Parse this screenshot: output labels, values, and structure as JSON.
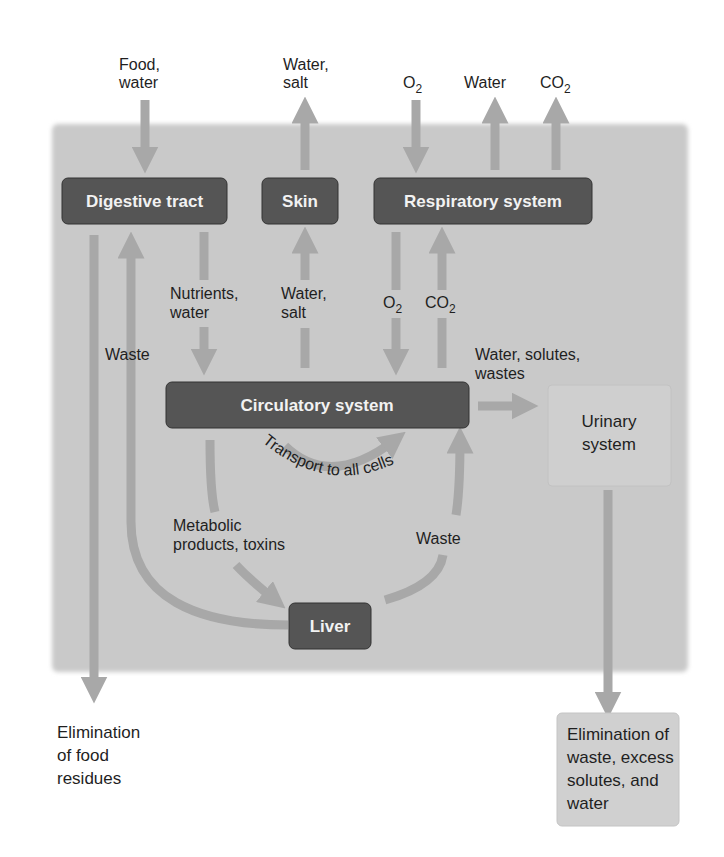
{
  "colors": {
    "panel": "#c9c9c9",
    "dark_box": "#555555",
    "light_box": "#d0d0d0",
    "arrow": "#a8a8a8",
    "background": "#ffffff"
  },
  "nodes": {
    "digestive": "Digestive tract",
    "skin": "Skin",
    "respiratory": "Respiratory system",
    "circulatory": "Circulatory system",
    "liver": "Liver",
    "urinary": [
      "Urinary",
      "system"
    ],
    "elim_food": [
      "Elimination",
      "of food",
      "residues"
    ],
    "elim_waste": [
      "Elimination of",
      "waste, excess",
      "solutes, and",
      "water"
    ]
  },
  "labels": {
    "food_in": [
      "Food,",
      "water"
    ],
    "skin_out": [
      "Water,",
      "salt"
    ],
    "o2_in": "O",
    "o2_sub": "2",
    "water_out": "Water",
    "co2_out": "CO",
    "co2_sub": "2",
    "nutrients": [
      "Nutrients,",
      "water"
    ],
    "skin_water": [
      "Water,",
      "salt"
    ],
    "o2_inner": "O",
    "o2_inner_sub": "2",
    "co2_inner": "CO",
    "co2_inner_sub": "2",
    "waste_left": "Waste",
    "to_urinary": [
      "Water, solutes,",
      "wastes"
    ],
    "transport": "Transport to all cells",
    "metabolic": [
      "Metabolic",
      "products, toxins"
    ],
    "waste_liver": "Waste"
  }
}
